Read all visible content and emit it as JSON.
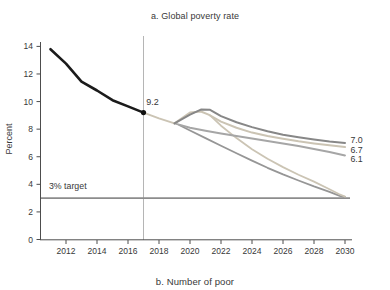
{
  "page": {
    "panel_b_caption": "b. Number of poor"
  },
  "chart_data": {
    "type": "line",
    "title": "a. Global poverty rate",
    "xlabel": "",
    "ylabel": "Percent",
    "xlim": [
      2010.7,
      2030.9
    ],
    "ylim": [
      0,
      14.8
    ],
    "x_ticks": [
      2012,
      2014,
      2016,
      2018,
      2020,
      2022,
      2024,
      2026,
      2028,
      2030
    ],
    "y_ticks": [
      0,
      2,
      4,
      6,
      8,
      10,
      12,
      14
    ],
    "grid": false,
    "legend": "none",
    "colors": {
      "historical": "#1b1b1b",
      "covid_downside": "#878787",
      "covid_baseline": "#cbc4b4",
      "pre_covid": "#a6a6a6",
      "target_path_covid": "#cbc4b4",
      "target_path_pre_covid": "#969696",
      "target_line": "#8c8c8c",
      "forecast_vline": "#b5b5b5",
      "axis": "#4d4d4d",
      "text": "#383838"
    },
    "reference_lines": {
      "target_value": 3,
      "target_label": "3% target",
      "forecast_start_year": 2017,
      "forecast_start_value": 9.2
    },
    "series": [
      {
        "id": "target-path-pre-covid",
        "name": "path needed to reach 3% target (pre-crisis trend)",
        "color": "#969696",
        "width": 1.8,
        "x": [
          2019.3,
          2020,
          2021,
          2022,
          2023,
          2024,
          2025,
          2026,
          2027,
          2028,
          2029,
          2029.7,
          2030
        ],
        "y": [
          8.3,
          7.9,
          7.35,
          6.8,
          6.25,
          5.72,
          5.2,
          4.72,
          4.28,
          3.85,
          3.45,
          3.15,
          3.08
        ]
      },
      {
        "id": "target-path-covid",
        "name": "path needed to reach 3% target (post-shock)",
        "color": "#cbc4b4",
        "width": 1.8,
        "x": [
          2021.3,
          2022,
          2023,
          2024,
          2025,
          2026,
          2027,
          2028,
          2029,
          2029.6,
          2030
        ],
        "y": [
          9.0,
          8.25,
          7.35,
          6.55,
          5.85,
          5.25,
          4.7,
          4.2,
          3.65,
          3.3,
          3.1
        ]
      },
      {
        "id": "pre-covid",
        "name": "pre-crisis projection",
        "color": "#a6a6a6",
        "width": 2,
        "end_label": "6.1",
        "x": [
          2019,
          2020,
          2021,
          2022,
          2023,
          2024,
          2025,
          2026,
          2027,
          2028,
          2029,
          2030
        ],
        "y": [
          8.42,
          8.1,
          7.88,
          7.68,
          7.5,
          7.32,
          7.15,
          6.97,
          6.78,
          6.57,
          6.35,
          6.1
        ]
      },
      {
        "id": "covid-baseline",
        "name": "baseline scenario",
        "color": "#cbc4b4",
        "width": 2,
        "end_label": "6.7",
        "x": [
          2017,
          2018,
          2019,
          2020,
          2020.7,
          2021.2,
          2022,
          2023,
          2024,
          2025,
          2026,
          2027,
          2028,
          2029,
          2030
        ],
        "y": [
          9.2,
          8.78,
          8.42,
          9.2,
          9.28,
          9.05,
          8.55,
          8.1,
          7.75,
          7.5,
          7.3,
          7.12,
          6.97,
          6.83,
          6.7
        ]
      },
      {
        "id": "covid-downside",
        "name": "downside scenario",
        "color": "#878787",
        "width": 2,
        "end_label": "7.0",
        "x": [
          2019,
          2020,
          2020.7,
          2021.3,
          2022,
          2023,
          2024,
          2025,
          2026,
          2027,
          2028,
          2029,
          2030
        ],
        "y": [
          8.42,
          9.05,
          9.42,
          9.4,
          8.95,
          8.5,
          8.15,
          7.85,
          7.6,
          7.42,
          7.25,
          7.1,
          7.0
        ]
      },
      {
        "id": "historical",
        "name": "historical",
        "color": "#1b1b1b",
        "width": 2.6,
        "x": [
          2011,
          2012,
          2013,
          2014,
          2015,
          2016,
          2017
        ],
        "y": [
          13.8,
          12.75,
          11.45,
          10.8,
          10.1,
          9.65,
          9.2
        ]
      }
    ],
    "annotations": [
      {
        "id": "forecast-start-value-label",
        "text": "9.2",
        "x": 2017.18,
        "y": 9.95,
        "anchor": "start",
        "size": 9
      },
      {
        "id": "target-line-label",
        "text": "3% target",
        "x": 2010.9,
        "y": 3.85,
        "anchor": "start",
        "size": 8.8
      },
      {
        "id": "end-label-downside",
        "text": "7.0",
        "x": 2030.35,
        "y": 7.2,
        "anchor": "start",
        "size": 8.8
      },
      {
        "id": "end-label-baseline",
        "text": "6.7",
        "x": 2030.35,
        "y": 6.5,
        "anchor": "start",
        "size": 8.8
      },
      {
        "id": "end-label-precovid",
        "text": "6.1",
        "x": 2030.35,
        "y": 5.82,
        "anchor": "start",
        "size": 8.8
      }
    ]
  }
}
